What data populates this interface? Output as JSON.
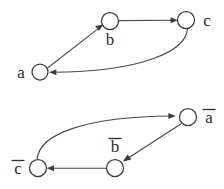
{
  "figure": {
    "background_color": "#ffffff",
    "stroke_color": "#3a3a3a",
    "label_color": "#2b2b2b"
  },
  "graphs": [
    {
      "id": "top-graph",
      "name": "primal-cycle",
      "nodes": [
        {
          "id": "a",
          "label": "a",
          "overline": false,
          "cx": 40,
          "cy": 72,
          "r": 8,
          "label_x": 21,
          "label_y": 78
        },
        {
          "id": "b",
          "label": "b",
          "overline": false,
          "cx": 110,
          "cy": 21,
          "r": 8.5,
          "label_x": 110,
          "label_y": 45
        },
        {
          "id": "c",
          "label": "c",
          "overline": false,
          "cx": 186,
          "cy": 20,
          "r": 8.5,
          "label_x": 207,
          "label_y": 20
        }
      ],
      "edges": [
        {
          "id": "a-to-b",
          "from": "a",
          "to": "b",
          "shape": "straight"
        },
        {
          "id": "b-to-c",
          "from": "b",
          "to": "c",
          "shape": "straight"
        },
        {
          "id": "c-to-a",
          "from": "c",
          "to": "a",
          "shape": "curved"
        }
      ]
    },
    {
      "id": "bottom-graph",
      "name": "dual-cycle",
      "nodes": [
        {
          "id": "c-bar",
          "label": "c",
          "overline": true,
          "cx": 38,
          "cy": 168,
          "r": 8.5,
          "label_x": 18,
          "label_y": 174
        },
        {
          "id": "b-bar",
          "label": "b",
          "overline": true,
          "cx": 115,
          "cy": 168,
          "r": 8.5,
          "label_x": 115,
          "label_y": 152
        },
        {
          "id": "a-bar",
          "label": "a",
          "overline": true,
          "cx": 188,
          "cy": 117,
          "r": 8.5,
          "label_x": 209,
          "label_y": 123
        }
      ],
      "edges": [
        {
          "id": "cbar-to-abar",
          "from": "c-bar",
          "to": "a-bar",
          "shape": "curved"
        },
        {
          "id": "abar-to-bbar",
          "from": "a-bar",
          "to": "b-bar",
          "shape": "straight"
        },
        {
          "id": "bbar-to-cbar",
          "from": "b-bar",
          "to": "c-bar",
          "shape": "straight"
        }
      ]
    }
  ]
}
